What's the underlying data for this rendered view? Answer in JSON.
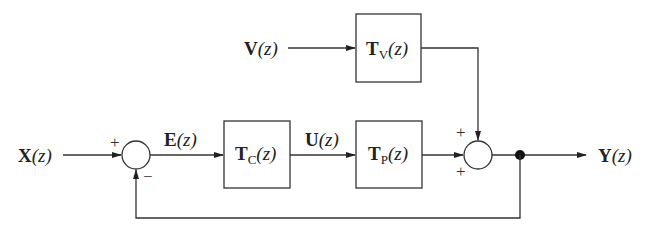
{
  "diagram": {
    "type": "feedback-control-block-diagram",
    "signals": {
      "input": {
        "name": "X",
        "arg": "(z)",
        "label": "X(z)"
      },
      "error": {
        "name": "E",
        "arg": "(z)",
        "label": "E(z)"
      },
      "control": {
        "name": "U",
        "arg": "(z)",
        "label": "U(z)"
      },
      "disturbance": {
        "name": "V",
        "arg": "(z)",
        "label": "V(z)"
      },
      "output": {
        "name": "Y",
        "arg": "(z)",
        "label": "Y(z)"
      }
    },
    "blocks": {
      "controller": {
        "name": "T",
        "sub": "C",
        "arg": "(z)",
        "label": "T_C(z)"
      },
      "plant": {
        "name": "T",
        "sub": "P",
        "arg": "(z)",
        "label": "T_P(z)"
      },
      "disturbance_tf": {
        "name": "T",
        "sub": "V",
        "arg": "(z)",
        "label": "T_V(z)"
      }
    },
    "junctions": {
      "error_sum": {
        "signs": {
          "input": "+",
          "feedback": "−"
        }
      },
      "output_sum": {
        "signs": {
          "top": "+",
          "bottom": "+"
        }
      }
    },
    "connections": [
      "X(z) → error_sum (+)",
      "error_sum → E(z) → T_C(z)",
      "T_C(z) → U(z) → T_P(z)",
      "T_P(z) → output_sum (+)",
      "V(z) → T_V(z) → output_sum (+)",
      "output_sum → pickoff → Y(z)",
      "pickoff → error_sum (−) feedback"
    ]
  }
}
